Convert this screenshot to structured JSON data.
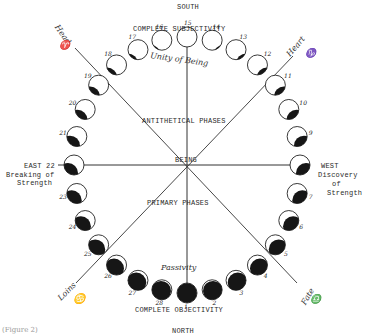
{
  "compass": {
    "south": "SOUTH",
    "north": "NORTH",
    "east": "EAST 22",
    "west": "WEST"
  },
  "labels": {
    "top": "COMPLETE SUBJECTIVITY",
    "bottom": "COMPLETE OBJECTIVITY",
    "unity": "Unity of Being",
    "passivity": "Passivity",
    "antithetical": "ANTITHETICAL PHASES",
    "primary": "PRIMARY PHASES",
    "center": "BEING",
    "east_sub": [
      "Breaking of",
      "Strength"
    ],
    "west_sub": [
      "Discovery",
      "of",
      "Strength"
    ]
  },
  "axes": {
    "head": "Head",
    "head_sign": "♈",
    "heart": "Heart",
    "heart_sign": "♑",
    "loins": "Loins",
    "loins_sign": "♋",
    "fate": "Fate",
    "fate_sign": "♎"
  },
  "caption": "(Figure 2)",
  "phases": [
    {
      "n": "1"
    },
    {
      "n": "2"
    },
    {
      "n": "3"
    },
    {
      "n": "4"
    },
    {
      "n": "5"
    },
    {
      "n": "6"
    },
    {
      "n": "7"
    },
    {
      "n": "8"
    },
    {
      "n": "9"
    },
    {
      "n": "10"
    },
    {
      "n": "11"
    },
    {
      "n": "12"
    },
    {
      "n": "13"
    },
    {
      "n": "14"
    },
    {
      "n": "15"
    },
    {
      "n": "16"
    },
    {
      "n": "17"
    },
    {
      "n": "18"
    },
    {
      "n": "19"
    },
    {
      "n": "20"
    },
    {
      "n": "21"
    },
    {
      "n": "22"
    },
    {
      "n": "23"
    },
    {
      "n": "24"
    },
    {
      "n": "25"
    },
    {
      "n": "26"
    },
    {
      "n": "27"
    },
    {
      "n": "28"
    }
  ],
  "colors": {
    "ink": "#1a1a1a",
    "paper": "#ffffff",
    "line": "#333333"
  }
}
